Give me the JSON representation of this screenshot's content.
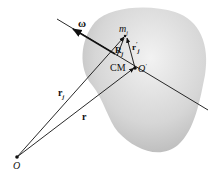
{
  "diagram": {
    "type": "rigid-body-rotation",
    "body": {
      "description": "irregular rigid body",
      "fill": "#d4d4d4"
    },
    "axis": {
      "label": "ω",
      "description": "rotation axis through CM"
    },
    "points": {
      "origin": {
        "label": "O"
      },
      "cm": {
        "label": "CM",
        "point_label": "O",
        "point_prime": "′"
      },
      "mass": {
        "label": "m",
        "subscript": "j"
      }
    },
    "vectors": {
      "r_j": {
        "label": "r",
        "subscript": "j",
        "from": "O",
        "to": "m_j"
      },
      "r": {
        "label": "r",
        "from": "O",
        "to": "O′"
      },
      "r_prime_j": {
        "label": "r",
        "prime": "′",
        "subscript": "j",
        "from": "O′",
        "to": "m_j"
      },
      "R_j": {
        "label": "R",
        "subscript": "j",
        "description": "perpendicular from axis to m_j"
      }
    },
    "colors": {
      "line": "#111111",
      "body_light": "#eeeeee",
      "body_dark": "#b8b8b8"
    }
  }
}
